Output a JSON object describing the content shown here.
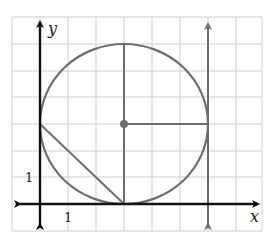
{
  "diagram": {
    "type": "coordinate-graph",
    "axes": {
      "x_label": "x",
      "y_label": "y",
      "x_tick_label": "1",
      "y_tick_label": "1"
    },
    "grid": {
      "x_min": -1,
      "x_max": 8,
      "y_min": -1,
      "y_max": 7
    },
    "circle": {
      "center": [
        3,
        3
      ],
      "radius": 3
    },
    "center_point": [
      3,
      3
    ],
    "radius_segments": [
      {
        "from": [
          3,
          3
        ],
        "to": [
          3,
          6
        ]
      },
      {
        "from": [
          3,
          3
        ],
        "to": [
          3,
          0
        ]
      },
      {
        "from": [
          3,
          3
        ],
        "to": [
          6,
          3
        ]
      }
    ],
    "chord": {
      "from": [
        0,
        3
      ],
      "to": [
        3,
        0
      ]
    },
    "vertical_line": {
      "x": 6,
      "note": "tangent to circle"
    },
    "colors": {
      "grid": "#c8c8c8",
      "axis": "#111111",
      "shape": "#6e6e6e"
    }
  }
}
